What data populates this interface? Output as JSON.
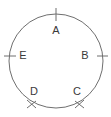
{
  "figure": {
    "kind": "circle-with-marked-points",
    "background_color": "#ffffff",
    "stroke_color": "#6f6f6f",
    "label_color": "#3a3a3a",
    "clipped_top_text": "",
    "circle": {
      "center_x": 56,
      "center_y": 61,
      "radius": 47
    },
    "points": [
      {
        "id": "A",
        "label": "A",
        "angle_deg": 90,
        "tick_style": "cross",
        "tick_angle_deg": 0,
        "label_x": 56,
        "label_y": 30,
        "tick_x": 56,
        "tick_y": 14
      },
      {
        "id": "B",
        "label": "B",
        "angle_deg": 0,
        "tick_style": "cross",
        "tick_angle_deg": 90,
        "label_x": 85,
        "label_y": 56,
        "tick_x": 100,
        "tick_y": 56
      },
      {
        "id": "C",
        "label": "C",
        "angle_deg": 305,
        "tick_style": "slash",
        "tick_angle_deg": 35,
        "label_x": 76,
        "label_y": 92,
        "tick_x": 79,
        "tick_y": 104
      },
      {
        "id": "D",
        "label": "D",
        "angle_deg": 235,
        "tick_style": "slash",
        "tick_angle_deg": -35,
        "label_x": 34,
        "label_y": 92,
        "tick_x": 31,
        "tick_y": 104
      },
      {
        "id": "E",
        "label": "E",
        "angle_deg": 180,
        "tick_style": "cross",
        "tick_angle_deg": 90,
        "label_x": 23,
        "label_y": 56,
        "tick_x": 11,
        "tick_y": 56
      }
    ]
  }
}
